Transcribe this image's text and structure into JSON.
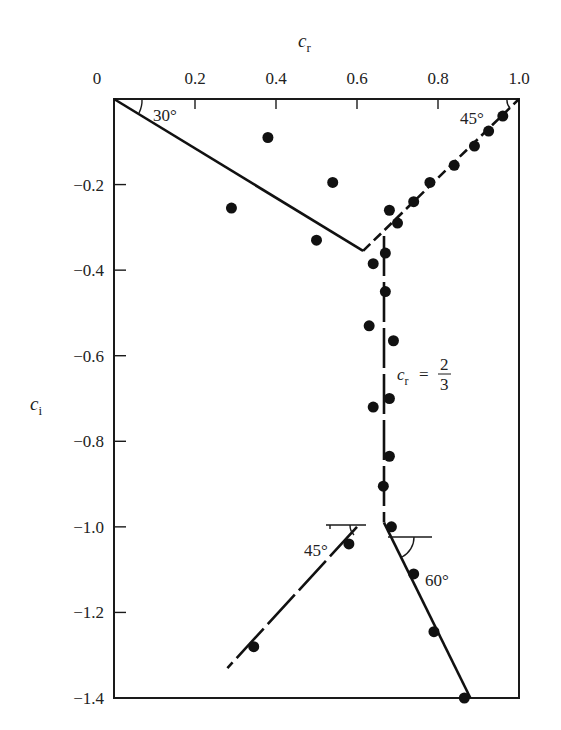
{
  "chart_data": {
    "type": "scatter",
    "title": "",
    "xlabel": "c_r",
    "ylabel": "c_i",
    "xlabel_display": {
      "base": "c",
      "sub": "r"
    },
    "ylabel_display": {
      "base": "c",
      "sub": "i"
    },
    "xlim": [
      0,
      1.0
    ],
    "ylim": [
      -1.4,
      0
    ],
    "x_axis_position": "top",
    "grid": false,
    "legend": null,
    "x_ticks": [
      0,
      0.2,
      0.4,
      0.6,
      0.8,
      1.0
    ],
    "x_tick_labels": [
      "0",
      "0.2",
      "0.4",
      "0.6",
      "0.8",
      "1.0"
    ],
    "y_ticks": [
      -0.2,
      -0.4,
      -0.6,
      -0.8,
      -1.0,
      -1.2,
      -1.4
    ],
    "y_tick_labels": [
      "−0.2",
      "−0.4",
      "−0.6",
      "−0.8",
      "−1.0",
      "−1.2",
      "−1.4"
    ],
    "series": [
      {
        "name": "data points",
        "kind": "scatter",
        "marker": "filled-circle",
        "points": [
          {
            "x": 0.38,
            "y": -0.09
          },
          {
            "x": 0.54,
            "y": -0.195
          },
          {
            "x": 0.29,
            "y": -0.255
          },
          {
            "x": 0.5,
            "y": -0.33
          },
          {
            "x": 0.68,
            "y": -0.26
          },
          {
            "x": 0.7,
            "y": -0.29
          },
          {
            "x": 0.67,
            "y": -0.36
          },
          {
            "x": 0.64,
            "y": -0.385
          },
          {
            "x": 0.67,
            "y": -0.45
          },
          {
            "x": 0.74,
            "y": -0.24
          },
          {
            "x": 0.78,
            "y": -0.195
          },
          {
            "x": 0.84,
            "y": -0.155
          },
          {
            "x": 0.89,
            "y": -0.11
          },
          {
            "x": 0.925,
            "y": -0.075
          },
          {
            "x": 0.96,
            "y": -0.04
          },
          {
            "x": 0.63,
            "y": -0.53
          },
          {
            "x": 0.69,
            "y": -0.565
          },
          {
            "x": 0.64,
            "y": -0.72
          },
          {
            "x": 0.68,
            "y": -0.7
          },
          {
            "x": 0.68,
            "y": -0.835
          },
          {
            "x": 0.665,
            "y": -0.905
          },
          {
            "x": 0.685,
            "y": -1.0
          },
          {
            "x": 0.58,
            "y": -1.04
          },
          {
            "x": 0.74,
            "y": -1.11
          },
          {
            "x": 0.79,
            "y": -1.245
          },
          {
            "x": 0.345,
            "y": -1.28
          },
          {
            "x": 0.865,
            "y": -1.4
          }
        ]
      },
      {
        "name": "30 deg line from origin",
        "kind": "line",
        "style": "solid",
        "points": [
          {
            "x": 0.0,
            "y": 0.0
          },
          {
            "x": 0.615,
            "y": -0.355
          }
        ]
      },
      {
        "name": "45 deg line from (1,0)",
        "kind": "line",
        "style": "dashed",
        "points": [
          {
            "x": 0.615,
            "y": -0.355
          },
          {
            "x": 1.0,
            "y": 0.0
          }
        ]
      },
      {
        "name": "c_r = 2/3 vertical",
        "kind": "line",
        "style": "broken",
        "points": [
          {
            "x": 0.6667,
            "y": -0.32
          },
          {
            "x": 0.6667,
            "y": -0.99
          }
        ]
      },
      {
        "name": "45 deg lower-left branch",
        "kind": "line",
        "style": "broken",
        "points": [
          {
            "x": 0.6,
            "y": -1.0
          },
          {
            "x": 0.28,
            "y": -1.33
          }
        ]
      },
      {
        "name": "60 deg lower-right branch",
        "kind": "line",
        "style": "solid",
        "points": [
          {
            "x": 0.6667,
            "y": -0.99
          },
          {
            "x": 0.88,
            "y": -1.4
          }
        ]
      }
    ],
    "annotations": [
      {
        "text": "30°",
        "x": 0.03,
        "y": -0.02,
        "meaning": "angle at origin"
      },
      {
        "text": "45°",
        "x": 0.91,
        "y": -0.02,
        "meaning": "angle at (1,0)"
      },
      {
        "text": "c_r = 2/3",
        "x": 0.71,
        "y": -0.63,
        "meaning": "vertical line label"
      },
      {
        "text": "45°",
        "x": 0.53,
        "y": -1.02,
        "meaning": "lower-left branch angle"
      },
      {
        "text": "60°",
        "x": 0.71,
        "y": -1.03,
        "meaning": "lower-right branch angle"
      }
    ]
  },
  "labels": {
    "x_title": "c",
    "x_sub": "r",
    "y_title": "c",
    "y_sub": "i",
    "angle_30": "30°",
    "angle_45_top": "45°",
    "angle_45_bottom": "45°",
    "angle_60": "60°",
    "vline_lhs": "c",
    "vline_lhs_sub": "r",
    "vline_eq": "=",
    "vline_num": "2",
    "vline_den": "3"
  }
}
